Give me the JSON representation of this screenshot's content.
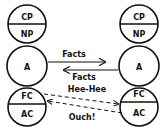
{
  "left_person": {
    "parent_circle": {
      "top": "CP",
      "bottom": "NP"
    },
    "adult_circle": {
      "label": "A"
    },
    "child_circle": {
      "top": "FC",
      "bottom": "AC"
    }
  },
  "right_person": {
    "parent_circle": {
      "top": "CP",
      "bottom": "NP"
    },
    "adult_circle": {
      "label": "A"
    },
    "child_circle": {
      "top": "FC",
      "bottom": "AC"
    }
  },
  "transactions": [
    {
      "label": "Facts",
      "from": "left A",
      "to": "right A",
      "style": "solid"
    },
    {
      "label": "Facts",
      "from": "right A",
      "to": "left A",
      "style": "solid"
    },
    {
      "label": "Hee-Hee",
      "from": "left FC",
      "to": "right AC",
      "style": "dashed"
    },
    {
      "label": "Ouch!",
      "from": "right AC",
      "to": "left FC",
      "style": "dashed"
    }
  ],
  "colors": {
    "stroke": "#111111",
    "background": "#ffffff"
  }
}
